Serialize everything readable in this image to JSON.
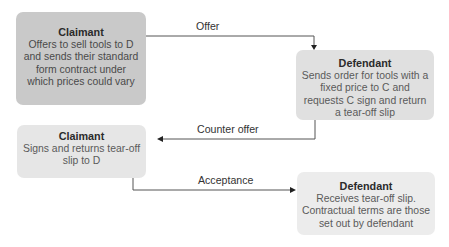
{
  "diagram": {
    "nodes": [
      {
        "id": "b1",
        "title": "Claimant",
        "text": "Offers to sell tools to D and sends their standard form contract under which prices could vary",
        "lines": [
          "Offers to sell tools to D",
          "and sends their standard",
          "form contract under",
          "which prices could vary"
        ]
      },
      {
        "id": "b2",
        "title": "Defendant",
        "text": "Sends order for tools with a fixed price to C and requests C sign and return a tear-off slip",
        "lines": [
          "Sends order for tools with a",
          "fixed price to C and",
          "requests C sign and return",
          "a tear-off slip"
        ]
      },
      {
        "id": "b3",
        "title": "Claimant",
        "text": "Signs and returns tear-off slip to D",
        "lines": [
          "Signs and returns tear-off",
          "slip to D"
        ]
      },
      {
        "id": "b4",
        "title": "Defendant",
        "text": "Receives tear-off slip. Contractual terms are those set out by defendant",
        "lines": [
          "Receives tear-off slip.",
          "Contractual terms are those",
          "set out by defendant"
        ]
      }
    ],
    "edges": [
      {
        "from": "b1",
        "to": "b2",
        "label": "Offer"
      },
      {
        "from": "b2",
        "to": "b3",
        "label": "Counter offer"
      },
      {
        "from": "b3",
        "to": "b4",
        "label": "Acceptance"
      }
    ],
    "colors": {
      "box1": "#c9c9c9",
      "box2": "#e0e0e0",
      "box3": "#e6e6e6",
      "box4": "#ececec",
      "line": "#555555"
    }
  }
}
